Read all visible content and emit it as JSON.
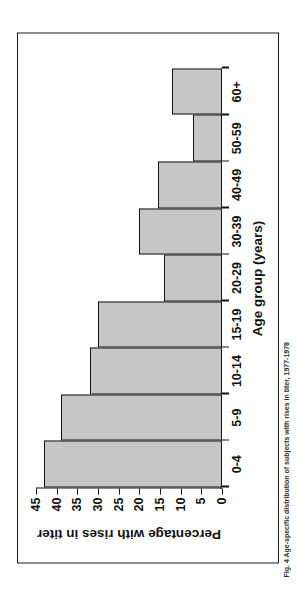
{
  "figure": {
    "caption_fragment": "Fig. 4  Age-specific distribution of subjects with rises in titer, 1977-1978"
  },
  "chart_data": {
    "type": "bar",
    "title": "",
    "subtitle": "",
    "orientation": "vertical",
    "categories": [
      "0-4",
      "5-9",
      "10-14",
      "15-19",
      "20-29",
      "30-39",
      "40-49",
      "50-59",
      "60+"
    ],
    "values": [
      43,
      39,
      32,
      30,
      14,
      20,
      15.5,
      7,
      12
    ],
    "series": [
      {
        "name": "Percentage with rises in titer",
        "values": [
          43,
          39,
          32,
          30,
          14,
          20,
          15.5,
          7,
          12
        ]
      }
    ],
    "xlabel": "Age group (years)",
    "ylabel": "Percentage with rises in titer",
    "ylim": [
      0,
      45
    ],
    "ytick_step": 5,
    "ytick_labels": [
      "0",
      "5",
      "10",
      "15",
      "20",
      "25",
      "30",
      "35",
      "40",
      "45"
    ],
    "ytick_values": [
      0,
      5,
      10,
      15,
      20,
      25,
      30,
      35,
      40,
      45
    ],
    "grid": false,
    "legend": false,
    "legend_position": "none",
    "bar_fill_color": "#c6c6c6",
    "bar_edge_color": "#141414",
    "axis_color": "#111111",
    "background_color": "#ffffff",
    "frame_border": true
  }
}
